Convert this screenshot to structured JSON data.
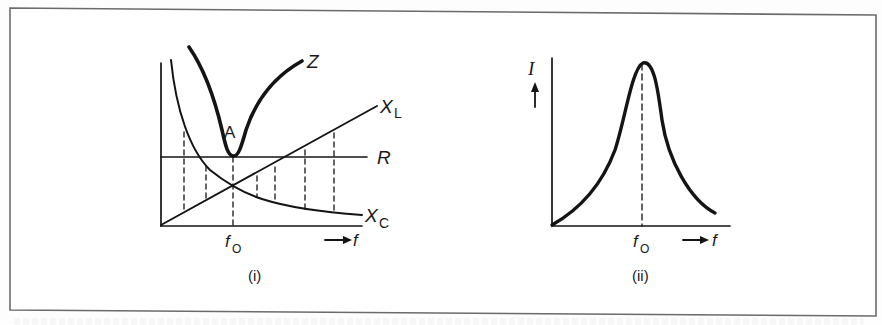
{
  "figure": {
    "frame": {
      "x1": 10,
      "y1": 8,
      "x2": 876,
      "y2": 316,
      "color": "#6b6b6b"
    },
    "ink_color": "#141414",
    "panel_i": {
      "caption": "(i)",
      "labels": {
        "Z": "Z",
        "A": "A",
        "XL_main": "X",
        "XL_sub": "L",
        "R": "R",
        "XC_main": "X",
        "XC_sub": "C",
        "f0_main": "f",
        "f0_sub": "O",
        "f_axis": "f"
      },
      "curves": [
        "Z (impedance)",
        "X_L (inductive reactance)",
        "R (resistance)",
        "X_C (capacitive reactance)"
      ],
      "point_label": "A",
      "resonance_marker": "f0"
    },
    "panel_ii": {
      "caption": "(ii)",
      "labels": {
        "I": "I",
        "f0_main": "f",
        "f0_sub": "O",
        "f_axis": "f"
      },
      "curves": [
        "I (current resonance curve)"
      ],
      "resonance_marker": "f0"
    }
  }
}
